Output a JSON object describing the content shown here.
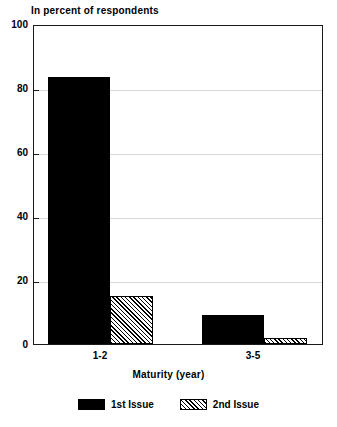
{
  "chart_data": {
    "type": "bar",
    "title": "In percent of respondents",
    "xlabel": "Maturity (year)",
    "ylabel": "",
    "categories": [
      "1-2",
      "3-5"
    ],
    "series": [
      {
        "name": "1st Issue",
        "values": [
          84,
          9
        ],
        "fill": "solid",
        "color": "#000000"
      },
      {
        "name": "2nd Issue",
        "values": [
          15,
          2
        ],
        "fill": "hatch",
        "color": "#000000"
      }
    ],
    "ylim": [
      0,
      100
    ],
    "yticks": [
      0,
      20,
      40,
      60,
      80,
      100
    ],
    "ytick_labels": [
      "0",
      "20",
      "40",
      "60",
      "80",
      "100"
    ],
    "grid": true,
    "legend_position": "bottom"
  },
  "legend": {
    "items": [
      {
        "label": "1st Issue",
        "swatch": "solid"
      },
      {
        "label": "2nd Issue",
        "swatch": "hatch"
      }
    ]
  }
}
